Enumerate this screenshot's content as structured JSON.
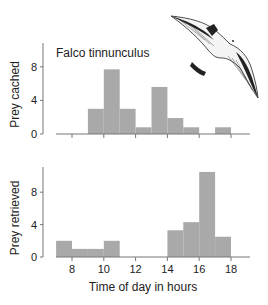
{
  "chart_data": [
    {
      "type": "bar",
      "title": "Falco tinnunculus",
      "xlabel": "",
      "ylabel": "Prey cached",
      "ylim": [
        0,
        10
      ],
      "yticks": [
        0,
        4,
        8
      ],
      "xlim": [
        7,
        19
      ],
      "xticks": [
        8,
        10,
        12,
        14,
        16,
        18
      ],
      "bin_width_hours": 1,
      "bins": [
        {
          "start": 9,
          "end": 10,
          "value": 3
        },
        {
          "start": 10,
          "end": 11,
          "value": 7.7
        },
        {
          "start": 11,
          "end": 12,
          "value": 3
        },
        {
          "start": 12,
          "end": 13,
          "value": 0.8
        },
        {
          "start": 13,
          "end": 14,
          "value": 5.6
        },
        {
          "start": 14,
          "end": 15,
          "value": 1.9
        },
        {
          "start": 15,
          "end": 16,
          "value": 0.8
        },
        {
          "start": 17,
          "end": 18,
          "value": 0.8
        }
      ]
    },
    {
      "type": "bar",
      "title": "",
      "xlabel": "Time of day in hours",
      "ylabel": "Prey retrieved",
      "ylim": [
        0,
        11
      ],
      "yticks": [
        0,
        4,
        8
      ],
      "xlim": [
        7,
        19
      ],
      "xticks": [
        8,
        10,
        12,
        14,
        16,
        18
      ],
      "bin_width_hours": 1,
      "bins": [
        {
          "start": 7,
          "end": 8,
          "value": 2
        },
        {
          "start": 8,
          "end": 9,
          "value": 1
        },
        {
          "start": 9,
          "end": 10,
          "value": 1
        },
        {
          "start": 10,
          "end": 11,
          "value": 2
        },
        {
          "start": 14,
          "end": 15,
          "value": 3.3
        },
        {
          "start": 15,
          "end": 16,
          "value": 4.3
        },
        {
          "start": 16,
          "end": 17,
          "value": 10.5
        },
        {
          "start": 17,
          "end": 18,
          "value": 2.5
        }
      ]
    }
  ],
  "colors": {
    "bar": "#a9a9a9",
    "axis": "#777777",
    "text": "#222222"
  },
  "illustration": {
    "subject": "kestrel-in-flight"
  }
}
